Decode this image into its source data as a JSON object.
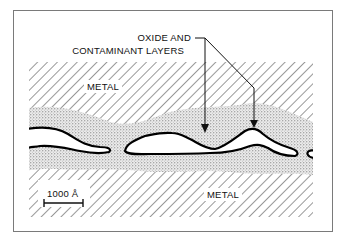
{
  "diagram": {
    "callout_label_line1": "OXIDE AND",
    "callout_label_line2": "CONTAMINANT LAYERS",
    "upper_region_label": "METAL",
    "lower_region_label": "METAL",
    "scale_bar_label": "1000 Å",
    "colors": {
      "frame": "#7a7a7a",
      "hatch": "#333333",
      "stipple": "#555555",
      "outline": "#000000",
      "background": "#ffffff"
    }
  }
}
